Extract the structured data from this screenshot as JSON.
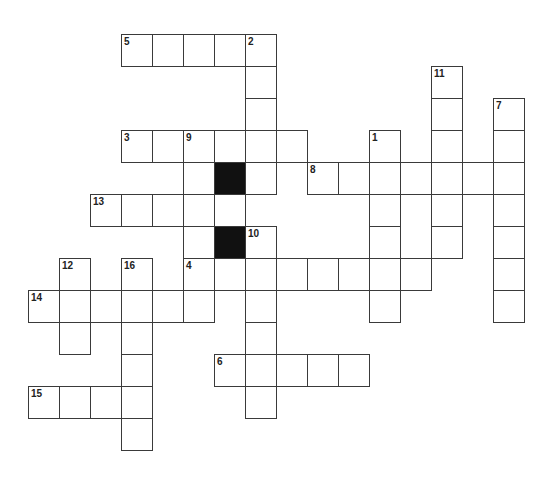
{
  "puzzle": {
    "grid": {
      "origin_x": 28,
      "origin_y": 34,
      "cell_w": 31,
      "cell_h": 32,
      "line_color": "#3a3a3a",
      "block_color": "#111111"
    },
    "entries": [
      {
        "number": "5",
        "direction": "across",
        "row": 0,
        "col": 3,
        "length": 5
      },
      {
        "number": "2",
        "direction": "down",
        "row": 0,
        "col": 7,
        "length": 5
      },
      {
        "number": "11",
        "direction": "down",
        "row": 1,
        "col": 13,
        "length": 6
      },
      {
        "number": "7",
        "direction": "down",
        "row": 2,
        "col": 15,
        "length": 7
      },
      {
        "number": "3",
        "direction": "across",
        "row": 3,
        "col": 3,
        "length": 6
      },
      {
        "number": "9",
        "direction": "down",
        "row": 3,
        "col": 5,
        "length": 6
      },
      {
        "number": "1",
        "direction": "down",
        "row": 3,
        "col": 11,
        "length": 6
      },
      {
        "number": "8",
        "direction": "across",
        "row": 4,
        "col": 9,
        "length": 7
      },
      {
        "number": "13",
        "direction": "across",
        "row": 5,
        "col": 2,
        "length": 5
      },
      {
        "number": "10",
        "direction": "down",
        "row": 6,
        "col": 7,
        "length": 6
      },
      {
        "number": "4",
        "direction": "across",
        "row": 7,
        "col": 5,
        "length": 8
      },
      {
        "number": "12",
        "direction": "down",
        "row": 7,
        "col": 1,
        "length": 3
      },
      {
        "number": "16",
        "direction": "down",
        "row": 7,
        "col": 3,
        "length": 6
      },
      {
        "number": "14",
        "direction": "across",
        "row": 8,
        "col": 0,
        "length": 6
      },
      {
        "number": "6",
        "direction": "across",
        "row": 10,
        "col": 6,
        "length": 5
      },
      {
        "number": "15",
        "direction": "across",
        "row": 11,
        "col": 0,
        "length": 4
      }
    ],
    "black_cells": [
      {
        "row": 4,
        "col": 6
      },
      {
        "row": 6,
        "col": 6
      }
    ]
  }
}
